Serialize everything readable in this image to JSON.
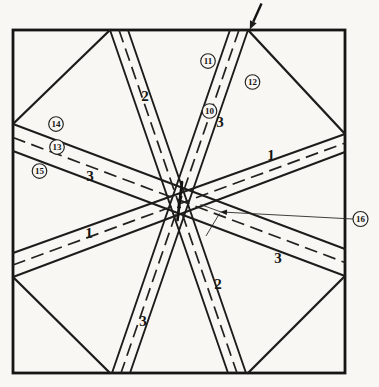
{
  "figure": {
    "type": "technical-diagram",
    "paper_color": "#f8f7f3",
    "ink_color": "#1d1c1a",
    "band_labels": {
      "band1_left": "1",
      "band1_right": "1",
      "band2_upper": "2",
      "band2_lower": "2",
      "band3_steep_upper": "3",
      "band3_steep_lower": "3",
      "band3_flat_left": "3",
      "band3_flat_right": "3"
    },
    "references": {
      "r10": "10",
      "r11": "11",
      "r12": "12",
      "r13": "13",
      "r14": "14",
      "r15": "15",
      "r16": "16"
    },
    "icons": {
      "top_edge_arrow": "filled-arrow-pointing-down-left",
      "leader_arrow": "open-arrow-pointing-left"
    }
  }
}
